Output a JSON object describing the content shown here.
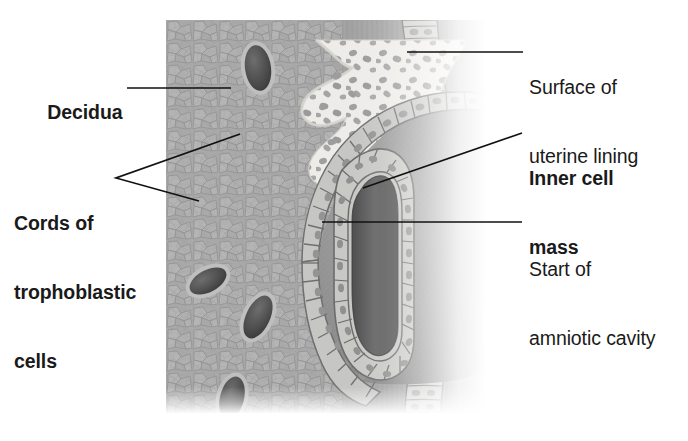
{
  "figure": {
    "panel": {
      "x": 166,
      "y": 20,
      "width": 334,
      "height": 393
    },
    "colors": {
      "decidua_base": "#a9a9a9",
      "decidua_cell_light": "#b6b6b6",
      "decidua_cell_outline": "#8e8e8e",
      "trophoblast_light": "#ededea",
      "trophoblast_nucleus": "#9b9b9b",
      "epithelium_fill": "#c9c9c7",
      "epithelium_outline": "#7d7d7d",
      "blastocyst_cavity": "#8f8f8f",
      "amniotic_cavity_dark": "#5a5a5a",
      "blood_vessel_dark": "#4c4c4c",
      "label_text": "#1a1a1a",
      "leader_line": "#111111",
      "background": "#ffffff"
    },
    "structures": [
      "decidua",
      "cords of trophoblastic cells",
      "surface of uterine lining",
      "inner cell mass",
      "start of amniotic cavity",
      "maternal blood vessels",
      "blastocyst cavity"
    ]
  },
  "labels": [
    {
      "id": "decidua",
      "text": "Decidua",
      "bold": true,
      "side": "left",
      "x": 26,
      "y": 78,
      "leader": {
        "type": "line",
        "points": [
          [
            127,
            88
          ],
          [
            231,
            88
          ]
        ]
      }
    },
    {
      "id": "cords-of-trophoblastic-cells",
      "line1": "Cords of",
      "line2": "trophoblastic",
      "line3": "cells",
      "text": "Cords of trophoblastic cells",
      "bold": true,
      "side": "left",
      "x": 14,
      "y": 166,
      "leader": {
        "type": "fork",
        "apex": [
          116,
          178
        ],
        "ends": [
          [
            240,
            134
          ],
          [
            199,
            201
          ]
        ]
      }
    },
    {
      "id": "surface-of-uterine-lining",
      "line1": "Surface of",
      "line2": "uterine lining",
      "text": "Surface of uterine lining",
      "bold": false,
      "side": "right",
      "x": 529,
      "y": 30,
      "leader": {
        "type": "line",
        "points": [
          [
            523,
            52
          ],
          [
            407,
            52
          ]
        ]
      }
    },
    {
      "id": "inner-cell-mass",
      "line1": "Inner cell",
      "line2": "mass",
      "text": "Inner cell mass",
      "bold": true,
      "side": "right",
      "x": 529,
      "y": 121,
      "leader": {
        "type": "line",
        "points": [
          [
            522,
            133
          ],
          [
            363,
            188
          ]
        ]
      }
    },
    {
      "id": "start-of-amniotic-cavity",
      "line1": "Start of",
      "line2": "amniotic cavity",
      "text": "Start of amniotic cavity",
      "bold": false,
      "side": "right",
      "x": 529,
      "y": 212,
      "leader": {
        "type": "line",
        "points": [
          [
            522,
            222
          ],
          [
            322,
            222
          ]
        ]
      }
    }
  ]
}
